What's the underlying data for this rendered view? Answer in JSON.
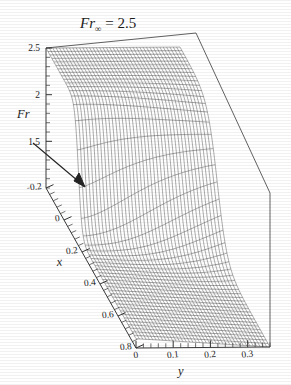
{
  "figure": {
    "title_main": "Fr",
    "title_sub": "∞",
    "title_eq": " = 2.5",
    "background": "#ffffff",
    "ink": "#2a2a2a"
  },
  "chart_data": {
    "type": "line",
    "plot_kind": "3d-wireframe-surface",
    "title": "Fr∞ = 2.5",
    "xlabel": "x",
    "ylabel": "y",
    "zlabel": "Fr",
    "grid": false,
    "legend": null,
    "axes": {
      "z": {
        "label": "Fr",
        "ticks": [
          2.5,
          2,
          1.5
        ],
        "tick_labels": [
          "2.5",
          "2",
          "1.5"
        ],
        "range": [
          1.0,
          2.5
        ],
        "minor_ticks_per_interval": 4
      },
      "x": {
        "label": "x",
        "ticks": [
          -0.2,
          0,
          0.2,
          0.4,
          0.6,
          0.8
        ],
        "tick_labels": [
          "-0.2",
          "0",
          "0.2",
          "0.4",
          "0.6",
          "0.8"
        ],
        "range": [
          -0.2,
          0.8
        ],
        "minor_ticks_per_interval": 4
      },
      "y": {
        "label": "y",
        "ticks": [
          0,
          0.1,
          0.2,
          0.3
        ],
        "tick_labels": [
          "0",
          "0.1",
          "0.2",
          "0.3"
        ],
        "range": [
          0,
          0.36
        ],
        "minor_ticks_per_interval": 4
      }
    },
    "annotations": [
      {
        "name": "flow-direction-arrow",
        "type": "arrow",
        "note": "diagonal arrow along x direction"
      }
    ],
    "surface": {
      "description": "Froude number surface with steep hydraulic-jump front; high plateau near Fr=2.5 at small x, dropping sharply to low Fr downstream.",
      "plateau_value": 2.5,
      "low_value": 1.0,
      "n_x_lines": 46,
      "n_y_lines": 40,
      "jump_center_x": 0.16,
      "jump_width": 0.085
    }
  }
}
